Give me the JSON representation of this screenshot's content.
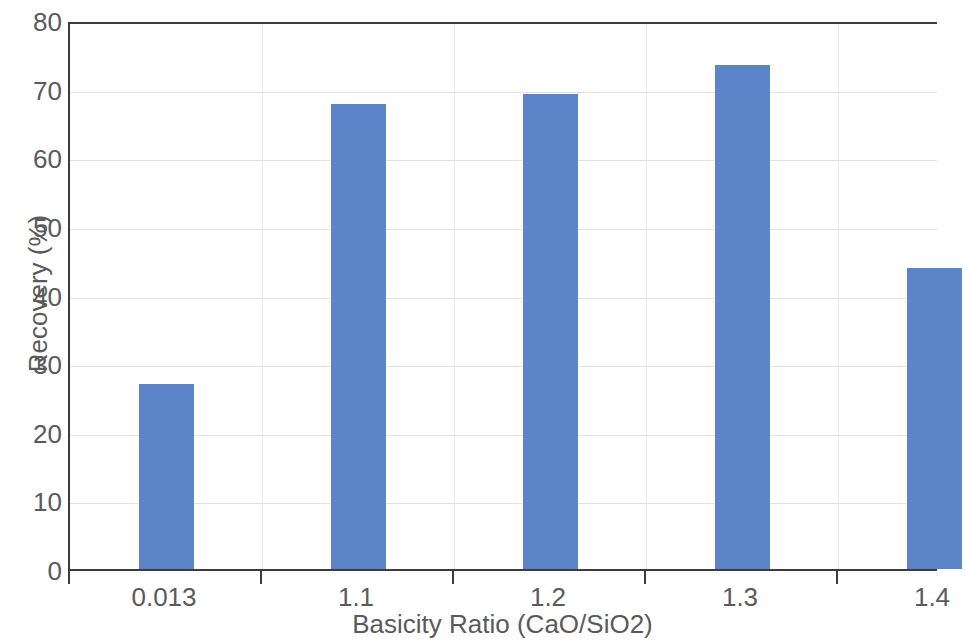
{
  "chart_data": {
    "type": "bar",
    "title": "",
    "subtitle": "",
    "xlabel": "Basicity Ratio (CaO/SiO2)",
    "ylabel": "Recovery (%)",
    "categories": [
      "0.013",
      "1.1",
      "1.2",
      "1.3",
      "1.4"
    ],
    "values": [
      27.0,
      67.8,
      69.2,
      73.4,
      43.9
    ],
    "series": [
      {
        "name": "Recovery",
        "values": [
          27.0,
          67.8,
          69.2,
          73.4,
          43.9
        ],
        "color": "#5b85c8"
      }
    ],
    "ylim": [
      0,
      80
    ],
    "ytick_step": 10,
    "ytick_labels": [
      "80",
      "70",
      "60",
      "50",
      "40",
      "30",
      "20",
      "10",
      "0"
    ],
    "xtick_labels": [
      "0.013",
      "1.1",
      "1.2",
      "1.3",
      "1.4"
    ],
    "grid": {
      "horizontal": true,
      "vertical": true,
      "color": "#e2e2e2"
    },
    "legend": {
      "visible": false,
      "position": "none",
      "entries": []
    },
    "annotations": [],
    "colors": {
      "bar": "#5b85c8",
      "axis_line": "#3c3c3c",
      "text": "#5a5a5a",
      "gridline": "#e2e2e2",
      "background": "#ffffff"
    }
  }
}
